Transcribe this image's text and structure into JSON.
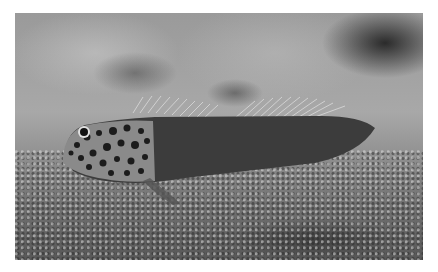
{
  "image": {
    "description": "Grayscale photograph of a spotted blenny fish resting on a sandy seabed",
    "subject": "blenny fish",
    "setting": "sandy sea floor",
    "color_mode": "grayscale",
    "colors": {
      "border": "#ffffff",
      "background_light": "#a8a8a8",
      "background_dark": "#2a2a2a",
      "fish_body": "#3a3a3a",
      "fish_head_spots": "#1e1e1e",
      "fish_head_base": "#b0b0b0"
    }
  }
}
